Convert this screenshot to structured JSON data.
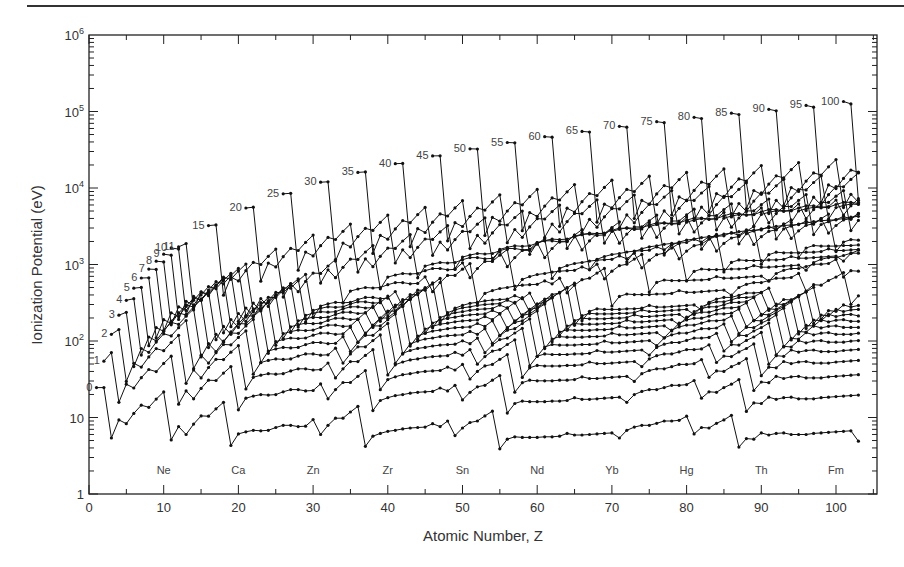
{
  "chart_data": {
    "type": "line",
    "title": "",
    "xlabel": "Atomic Number, Z",
    "ylabel": "Ionization Potential (eV)",
    "xlim": [
      0,
      105
    ],
    "ylim": [
      1,
      1000000
    ],
    "yscale": "log",
    "grid": false,
    "legend": "none (curves labeled inline by ionic charge)",
    "x_ticks": [
      0,
      10,
      20,
      30,
      40,
      50,
      60,
      70,
      80,
      90,
      100
    ],
    "x_tick_labels": [
      "0",
      "10",
      "20",
      "30",
      "40",
      "50",
      "60",
      "70",
      "80",
      "90",
      "100"
    ],
    "y_ticks": [
      {
        "value": 1,
        "base": "1",
        "exp": ""
      },
      {
        "value": 10,
        "base": "10",
        "exp": ""
      },
      {
        "value": 100,
        "base": "10",
        "exp": "2"
      },
      {
        "value": 1000,
        "base": "10",
        "exp": "3"
      },
      {
        "value": 10000,
        "base": "10",
        "exp": "4"
      },
      {
        "value": 100000,
        "base": "10",
        "exp": "5"
      },
      {
        "value": 1000000,
        "base": "10",
        "exp": "6"
      }
    ],
    "element_annotations": [
      {
        "symbol": "Ne",
        "z": 10
      },
      {
        "symbol": "Ca",
        "z": 20
      },
      {
        "symbol": "Zn",
        "z": 30
      },
      {
        "symbol": "Zr",
        "z": 40
      },
      {
        "symbol": "Sn",
        "z": 50
      },
      {
        "symbol": "Nd",
        "z": 60
      },
      {
        "symbol": "Yb",
        "z": 70
      },
      {
        "symbol": "Hg",
        "z": 80
      },
      {
        "symbol": "Th",
        "z": 90
      },
      {
        "symbol": "Fm",
        "z": 100
      }
    ],
    "series_labels": [
      "0",
      "1",
      "2",
      "3",
      "4",
      "5",
      "6",
      "7",
      "8",
      "9",
      "10",
      "11",
      "15",
      "20",
      "25",
      "30",
      "35",
      "40",
      "45",
      "50",
      "55",
      "60",
      "65",
      "70",
      "75",
      "80",
      "85",
      "90",
      "95",
      "100"
    ],
    "series_start_values_eV": {
      "0": 24.6,
      "1": 54.4,
      "2": 122.4,
      "3": 217.7,
      "4": 340.2,
      "5": 490,
      "6": 667,
      "7": 871,
      "8": 1103,
      "9": 1362,
      "10": 1649,
      "11": 1700,
      "15": 3224,
      "20": 5470,
      "25": 8400,
      "30": 11900,
      "35": 16000,
      "40": 20800,
      "45": 26300,
      "50": 32500,
      "55": 39300,
      "60": 46800,
      "65": 55000,
      "70": 64000,
      "75": 73500,
      "80": 84000,
      "85": 95000,
      "90": 107000,
      "95": 120000,
      "100": 135000
    }
  },
  "figure": {
    "neutral_curve_points": [
      [
        2,
        24.6
      ],
      [
        3,
        5.4
      ],
      [
        4,
        9.3
      ],
      [
        5,
        8.3
      ],
      [
        6,
        11.3
      ],
      [
        7,
        14.5
      ],
      [
        8,
        13.6
      ],
      [
        9,
        17.4
      ],
      [
        10,
        21.6
      ],
      [
        11,
        5.1
      ],
      [
        12,
        7.6
      ],
      [
        13,
        6.0
      ],
      [
        14,
        8.2
      ],
      [
        15,
        10.5
      ],
      [
        16,
        10.4
      ],
      [
        17,
        13.0
      ],
      [
        18,
        15.8
      ],
      [
        19,
        4.3
      ],
      [
        20,
        6.1
      ],
      [
        21,
        6.5
      ],
      [
        22,
        6.8
      ],
      [
        23,
        6.7
      ],
      [
        24,
        6.8
      ],
      [
        25,
        7.4
      ],
      [
        26,
        7.9
      ],
      [
        27,
        7.9
      ],
      [
        28,
        7.6
      ],
      [
        29,
        7.7
      ],
      [
        30,
        9.4
      ],
      [
        31,
        6.0
      ],
      [
        32,
        7.9
      ],
      [
        33,
        9.8
      ],
      [
        34,
        9.8
      ],
      [
        35,
        11.8
      ],
      [
        36,
        14.0
      ],
      [
        37,
        4.2
      ],
      [
        38,
        5.7
      ],
      [
        39,
        6.2
      ],
      [
        40,
        6.6
      ],
      [
        41,
        6.8
      ],
      [
        42,
        7.1
      ],
      [
        43,
        7.3
      ],
      [
        44,
        7.4
      ],
      [
        45,
        7.5
      ],
      [
        46,
        8.3
      ],
      [
        47,
        7.6
      ],
      [
        48,
        9.0
      ],
      [
        49,
        5.8
      ],
      [
        50,
        7.3
      ],
      [
        51,
        8.6
      ],
      [
        52,
        9.0
      ],
      [
        53,
        10.5
      ],
      [
        54,
        12.1
      ],
      [
        55,
        3.9
      ],
      [
        56,
        5.2
      ],
      [
        57,
        5.6
      ],
      [
        58,
        5.5
      ],
      [
        59,
        5.5
      ],
      [
        60,
        5.5
      ],
      [
        61,
        5.6
      ],
      [
        62,
        5.6
      ],
      [
        63,
        5.7
      ],
      [
        64,
        6.2
      ],
      [
        65,
        5.9
      ],
      [
        66,
        5.9
      ],
      [
        67,
        6.0
      ],
      [
        68,
        6.1
      ],
      [
        69,
        6.2
      ],
      [
        70,
        6.3
      ],
      [
        71,
        5.4
      ],
      [
        72,
        6.8
      ],
      [
        73,
        7.5
      ],
      [
        74,
        7.9
      ],
      [
        75,
        7.9
      ],
      [
        76,
        8.4
      ],
      [
        77,
        9.0
      ],
      [
        78,
        9.0
      ],
      [
        79,
        9.2
      ],
      [
        80,
        10.4
      ],
      [
        81,
        6.1
      ],
      [
        82,
        7.4
      ],
      [
        83,
        7.3
      ],
      [
        84,
        8.4
      ],
      [
        85,
        9.3
      ],
      [
        86,
        10.7
      ],
      [
        87,
        4.1
      ],
      [
        88,
        5.3
      ],
      [
        89,
        5.2
      ],
      [
        90,
        6.3
      ],
      [
        91,
        5.9
      ],
      [
        92,
        6.2
      ],
      [
        93,
        6.3
      ],
      [
        94,
        6.0
      ],
      [
        95,
        6.0
      ],
      [
        96,
        6.0
      ],
      [
        97,
        6.2
      ],
      [
        98,
        6.3
      ],
      [
        99,
        6.4
      ],
      [
        100,
        6.5
      ],
      [
        101,
        6.6
      ],
      [
        102,
        6.7
      ],
      [
        103,
        4.9
      ]
    ]
  }
}
